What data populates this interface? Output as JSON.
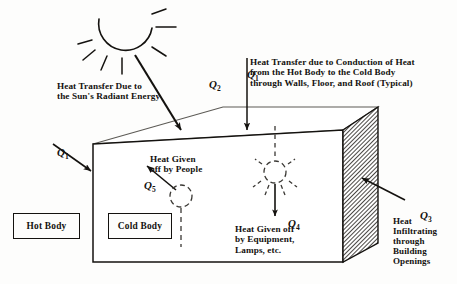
{
  "figure": {
    "background_color": "#fdfdfc",
    "ink_color": "#14120f"
  },
  "symbols": {
    "q1_left": "Q",
    "q1_left_sub": "1",
    "q1_top": "Q",
    "q1_top_sub": "1",
    "q2": "Q",
    "q2_sub": "2",
    "q3": "Q",
    "q3_sub": "3",
    "q4": "Q",
    "q4_sub": "4",
    "q5": "Q",
    "q5_sub": "5"
  },
  "captions": {
    "sun_radiant": "Heat Transfer Due to\nthe Sun's Radiant Energy",
    "conduction": "Heat Transfer due to Conduction of Heat\nfrom the Hot Body to the Cold Body\nthrough Walls, Floor, and Roof (Typical)",
    "people": "Heat Given\noff by People",
    "equipment": "Heat Given off\nby Equipment,\nLamps, etc.",
    "infiltration": "Heat\nInfiltrating\nthrough\nBuilding\nOpenings"
  },
  "legend_boxes": {
    "hot_body": "Hot Body",
    "cold_body": "Cold Body"
  },
  "elements": {
    "sun_icon": "sun-icon",
    "lamp_icon": "lamp-icon",
    "person_icon": "person-icon",
    "building_box": "building-box",
    "hatched_wall": "hatched-right-wall"
  }
}
